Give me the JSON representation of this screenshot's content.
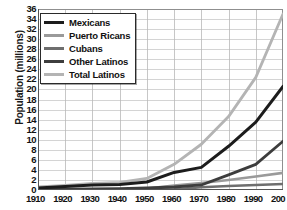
{
  "chart_data": {
    "type": "line",
    "title": "",
    "xlabel": "",
    "ylabel": "Population (millions)",
    "x": [
      1910,
      1920,
      1930,
      1940,
      1950,
      1960,
      1970,
      1980,
      1990,
      2000
    ],
    "xtick_labels": [
      "1910",
      "1920",
      "1930",
      "1940",
      "1950",
      "1960",
      "1970",
      "1980",
      "1990",
      "200"
    ],
    "ytick_labels": [
      "0",
      "2",
      "4",
      "6",
      "8",
      "10",
      "12",
      "14",
      "16",
      "18",
      "20",
      "22",
      "24",
      "26",
      "28",
      "30",
      "32",
      "34",
      "36"
    ],
    "ylim": [
      0,
      36
    ],
    "xlim": [
      1910,
      2000
    ],
    "ystep": 2,
    "grid": true,
    "legend_position": "top-left",
    "series": [
      {
        "name": "Mexicans",
        "color": "#1c1c1c",
        "width": 3.0,
        "values": [
          0.4,
          0.7,
          1.0,
          1.1,
          1.6,
          3.5,
          4.5,
          8.7,
          13.5,
          20.6
        ]
      },
      {
        "name": "Puerto Ricans",
        "color": "#9a9a9a",
        "width": 2.6,
        "values": [
          0.05,
          0.08,
          0.1,
          0.1,
          0.3,
          0.9,
          1.4,
          2.0,
          2.7,
          3.4
        ]
      },
      {
        "name": "Cubans",
        "color": "#6e6e6e",
        "width": 2.6,
        "values": [
          0.02,
          0.03,
          0.05,
          0.06,
          0.08,
          0.12,
          0.55,
          0.8,
          1.0,
          1.2
        ]
      },
      {
        "name": "Other Latinos",
        "color": "#3d3d3d",
        "width": 2.8,
        "values": [
          0.1,
          0.15,
          0.2,
          0.25,
          0.4,
          0.6,
          1.0,
          3.0,
          5.1,
          9.7
        ]
      },
      {
        "name": "Total Latinos",
        "color": "#b4b4b4",
        "width": 2.8,
        "values": [
          0.6,
          0.9,
          1.3,
          1.5,
          2.3,
          5.1,
          9.1,
          14.6,
          22.4,
          35.0
        ]
      }
    ]
  }
}
